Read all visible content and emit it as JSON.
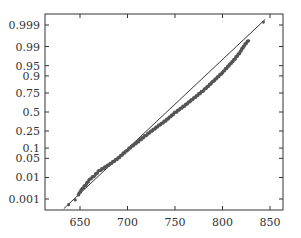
{
  "chart_data": {
    "type": "scatter",
    "title": "",
    "xlabel": "",
    "ylabel": "",
    "xlim": [
      622,
      864
    ],
    "x_ticks": [
      650,
      700,
      750,
      800,
      850
    ],
    "y_scale": "normal-probability",
    "y_ticks": [
      0.001,
      0.01,
      0.05,
      0.1,
      0.25,
      0.5,
      0.75,
      0.9,
      0.95,
      0.99,
      0.999
    ],
    "y_tick_labels": [
      "0.001",
      "0.01",
      "0.05",
      "0.1",
      "0.25",
      "0.5",
      "0.75",
      "0.9",
      "0.95",
      "0.99",
      "0.999"
    ],
    "grid": false,
    "legend": null,
    "reference_line": {
      "description": "fitted normal line",
      "points": [
        [
          633,
          0.0003
        ],
        [
          845,
          0.9995
        ]
      ]
    },
    "series": [
      {
        "name": "sample",
        "marker": "dot",
        "description": "dense sample quantiles closely following the reference line; small deviations in both tails",
        "points": [
          [
            638,
            0.0005
          ],
          [
            645,
            0.0009
          ],
          [
            648,
            0.0016
          ],
          [
            652,
            0.003
          ],
          [
            656,
            0.005
          ],
          [
            660,
            0.008
          ],
          [
            665,
            0.012
          ],
          [
            670,
            0.018
          ],
          [
            680,
            0.03
          ],
          [
            690,
            0.05
          ],
          [
            700,
            0.09
          ],
          [
            710,
            0.14
          ],
          [
            720,
            0.21
          ],
          [
            730,
            0.29
          ],
          [
            740,
            0.38
          ],
          [
            750,
            0.49
          ],
          [
            760,
            0.59
          ],
          [
            770,
            0.69
          ],
          [
            780,
            0.78
          ],
          [
            790,
            0.86
          ],
          [
            800,
            0.92
          ],
          [
            810,
            0.962
          ],
          [
            818,
            0.982
          ],
          [
            822,
            0.99
          ],
          [
            828,
            0.995
          ],
          [
            843,
            0.9993
          ]
        ]
      }
    ],
    "colors": {
      "points": "#555555",
      "line": "#222222",
      "frame": "#333333"
    }
  }
}
